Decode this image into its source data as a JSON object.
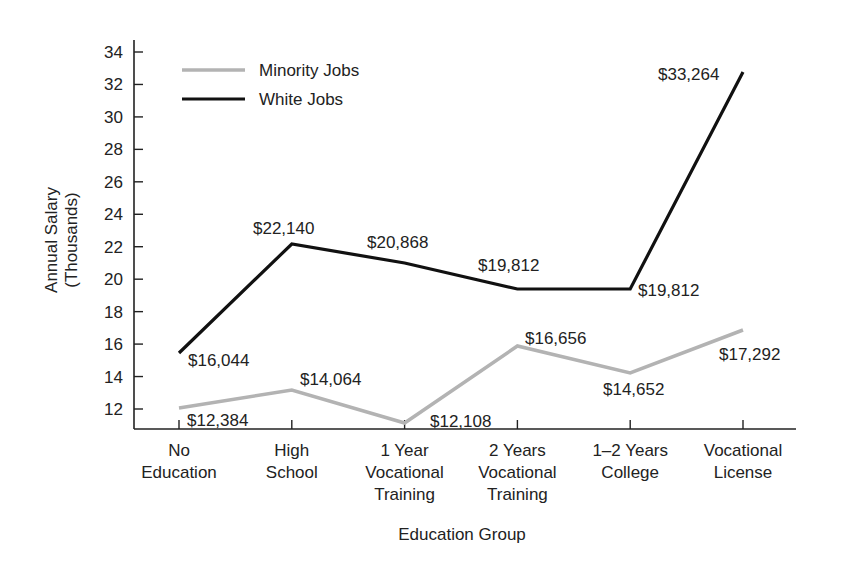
{
  "chart_data": {
    "type": "line",
    "title": "",
    "xlabel": "Education Group",
    "ylabel": "Annual Salary (Thousands)",
    "ylabel_lines": [
      "Annual Salary",
      "(Thousands)"
    ],
    "ylim": [
      11,
      35
    ],
    "yticks": [
      12,
      14,
      16,
      18,
      20,
      22,
      24,
      26,
      28,
      30,
      32,
      34
    ],
    "grid": false,
    "legend_position": "top-left",
    "categories": [
      "No Education",
      "High School",
      "1 Year Vocational Training",
      "2 Years Vocational Training",
      "1–2 Years College",
      "Vocational License"
    ],
    "category_lines": [
      [
        "No",
        "Education"
      ],
      [
        "High",
        "School"
      ],
      [
        "1 Year",
        "Vocational",
        "Training"
      ],
      [
        "2 Years",
        "Vocational",
        "Training"
      ],
      [
        "1–2 Years",
        "College"
      ],
      [
        "Vocational",
        "License"
      ]
    ],
    "series": [
      {
        "name": "Minority Jobs",
        "color": "#b3b3b3",
        "values": [
          12384,
          14064,
          12108,
          16656,
          14652,
          17292
        ],
        "labels": [
          "$12,384",
          "$14,064",
          "$12,108",
          "$16,656",
          "$14,652",
          "$17,292"
        ],
        "plot_y": [
          408,
          390,
          423,
          346,
          373,
          330
        ],
        "label_pos": [
          [
            187,
            426
          ],
          [
            300,
            385
          ],
          [
            430,
            427
          ],
          [
            525,
            344
          ],
          [
            603,
            395
          ],
          [
            719,
            360
          ]
        ]
      },
      {
        "name": "White Jobs",
        "color": "#111111",
        "values": [
          16044,
          22140,
          20868,
          19812,
          19812,
          33264
        ],
        "labels": [
          "$16,044",
          "$22,140",
          "$20,868",
          "$19,812",
          "$19,812",
          "$33,264"
        ],
        "plot_y": [
          353,
          244,
          263,
          289,
          289,
          72
        ],
        "label_pos": [
          [
            188,
            366
          ],
          [
            253,
            234
          ],
          [
            367,
            248
          ],
          [
            478,
            271
          ],
          [
            638,
            296
          ],
          [
            658,
            80
          ]
        ]
      }
    ]
  }
}
